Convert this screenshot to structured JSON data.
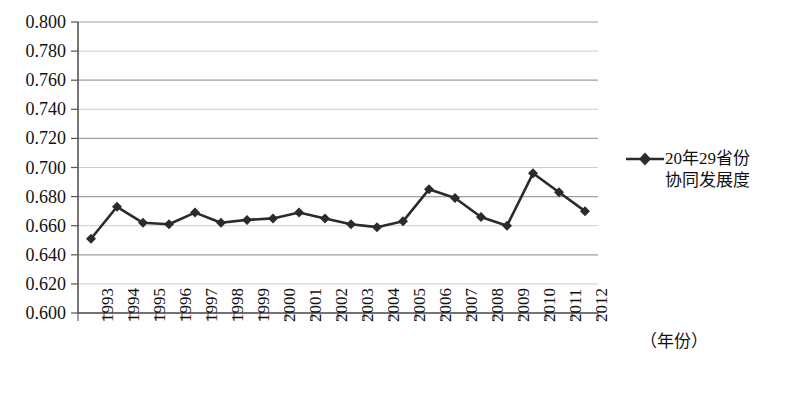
{
  "chart_data": {
    "type": "line",
    "title": "",
    "xlabel": "（年份）",
    "ylabel": "",
    "grid": true,
    "legend_position": "right",
    "ylim": [
      0.6,
      0.8
    ],
    "ytick_labels": [
      "0.800",
      "0.780",
      "0.760",
      "0.740",
      "0.720",
      "0.700",
      "0.680",
      "0.660",
      "0.640",
      "0.620",
      "0.600"
    ],
    "ytick_values": [
      0.8,
      0.78,
      0.76,
      0.74,
      0.72,
      0.7,
      0.68,
      0.66,
      0.64,
      0.62,
      0.6
    ],
    "categories": [
      "1993",
      "1994",
      "1995",
      "1996",
      "1997",
      "1998",
      "1999",
      "2000",
      "2001",
      "2002",
      "2003",
      "2004",
      "2005",
      "2006",
      "2007",
      "2008",
      "2009",
      "2010",
      "2011",
      "2012"
    ],
    "series": [
      {
        "name": "20年29省份协同发展度",
        "marker": "diamond",
        "color": "#2b2b2b",
        "values": [
          0.651,
          0.673,
          0.662,
          0.661,
          0.669,
          0.662,
          0.664,
          0.665,
          0.669,
          0.665,
          0.661,
          0.659,
          0.663,
          0.685,
          0.679,
          0.666,
          0.66,
          0.696,
          0.683,
          0.67
        ]
      }
    ]
  },
  "legend": {
    "entries": [
      {
        "label_line1": "20年29省份",
        "label_line2": "协同发展度"
      }
    ]
  },
  "axis": {
    "x_title": "（年份）"
  },
  "style": {
    "series_color": "#2b2b2b",
    "grid_color": "#9a9a9a",
    "axis_color": "#555555",
    "background": "#ffffff"
  }
}
